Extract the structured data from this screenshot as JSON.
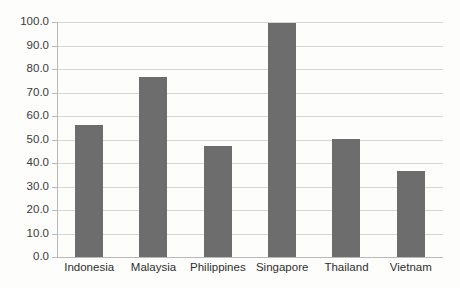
{
  "chart_data": {
    "type": "bar",
    "title": "",
    "subtitle": "",
    "xlabel": "",
    "ylabel": "",
    "categories": [
      "Indonesia",
      "Malaysia",
      "Philippines",
      "Singapore",
      "Thailand",
      "Vietnam"
    ],
    "values": [
      56.2,
      76.6,
      47.2,
      99.5,
      50.2,
      36.6
    ],
    "ylim": [
      0.0,
      100.0
    ],
    "ytick_labels": [
      "100.0",
      "90.0",
      "80.0",
      "70.0",
      "60.0",
      "50.0",
      "40.0",
      "30.0",
      "20.0",
      "10.0",
      "0.0"
    ],
    "ytick_values": [
      100.0,
      90.0,
      80.0,
      70.0,
      60.0,
      50.0,
      40.0,
      30.0,
      20.0,
      10.0,
      0.0
    ],
    "grid": true,
    "grid_axis": "y",
    "legend": false,
    "legend_position": "none",
    "bar_color": "#6d6d6d",
    "gridline_color": "#d6d6d6",
    "axis_color": "#b9b9b9",
    "background_color": "#fdfdfc",
    "annotations": []
  }
}
